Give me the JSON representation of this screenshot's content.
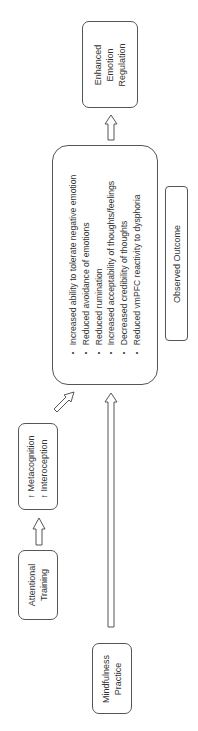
{
  "diagram": {
    "nodes": {
      "mindfulness_practice": {
        "lines": [
          "Mindfulness",
          "Practice"
        ]
      },
      "attentional_training": {
        "lines": [
          "Attentional",
          "Training"
        ]
      },
      "cognition": {
        "lines": [
          "↑ Metacognition",
          "↑ Interoception"
        ]
      },
      "effects": {
        "items": [
          "Increased ability to tolerate negative emotion",
          "Reduced avoidance of emotions",
          "Reduced rumination",
          "Increased acceptability of thoughts/feelings",
          "Decreased credibility of thoughts",
          "Reduced vmPFC reactivity to dysphoria"
        ]
      },
      "observed_outcome": {
        "label": "Observed Outcome"
      },
      "enhanced_regulation": {
        "lines": [
          "Enhanced",
          "Emotion",
          "Regulation"
        ]
      }
    },
    "edges": [
      {
        "from": "attentional_training",
        "to": "cognition"
      },
      {
        "from": "cognition",
        "to": "effects"
      },
      {
        "from": "mindfulness_practice",
        "to": "effects"
      },
      {
        "from": "effects",
        "to": "enhanced_regulation"
      }
    ],
    "colors": {
      "stroke": "#555555",
      "text": "#333333",
      "background": "#ffffff"
    }
  }
}
